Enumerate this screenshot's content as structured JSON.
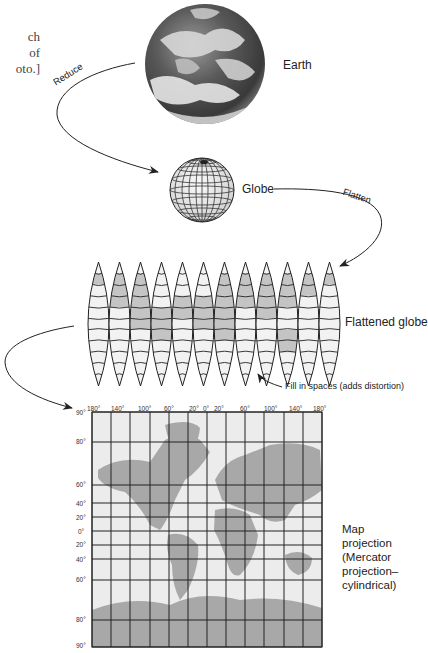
{
  "caption_fragment": [
    "ch",
    "of",
    "oto.]"
  ],
  "stages": {
    "earth": {
      "label": "Earth"
    },
    "globe": {
      "label": "Globe"
    },
    "flattened": {
      "label": "Flattened globe",
      "gore_count": 12
    },
    "map": {
      "label_lines": [
        "Map",
        "projection",
        "(Mercator",
        "projection–",
        "cylindrical)"
      ]
    }
  },
  "arrows": {
    "reduce": "Reduce",
    "flatten": "Flatten",
    "fill": "Fill in spaces (adds distortion)"
  },
  "map_axes": {
    "longitude_ticks": [
      "180°",
      "140°",
      "100°",
      "60°",
      "20°",
      "0°",
      "20°",
      "60°",
      "100°",
      "140°",
      "180°"
    ],
    "latitude_ticks": [
      "90°",
      "80°",
      "60°",
      "40°",
      "20°",
      "0°",
      "20°",
      "40°",
      "60°",
      "80°",
      "90°"
    ]
  },
  "colors": {
    "land": "#a8a8a8",
    "ocean": "#ececec",
    "grid": "#222222",
    "earth_dark": "#3a3a3a"
  }
}
